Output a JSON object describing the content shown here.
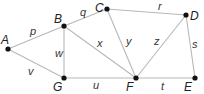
{
  "diagram": {
    "type": "undirected-graph",
    "colors": {
      "edge": "#b8b8b8",
      "node": "#111111",
      "text": "#222222"
    },
    "nodes": [
      {
        "id": "A",
        "label": "A",
        "x": 8,
        "y": 49,
        "lx": 1,
        "ly": 44
      },
      {
        "id": "B",
        "label": "B",
        "x": 64,
        "y": 26,
        "lx": 54,
        "ly": 23
      },
      {
        "id": "C",
        "label": "C",
        "x": 107,
        "y": 9,
        "lx": 95,
        "ly": 12
      },
      {
        "id": "D",
        "label": "D",
        "x": 186,
        "y": 15,
        "lx": 190,
        "ly": 20
      },
      {
        "id": "E",
        "label": "E",
        "x": 195,
        "y": 78,
        "lx": 184,
        "ly": 91
      },
      {
        "id": "F",
        "label": "F",
        "x": 136,
        "y": 78,
        "lx": 126,
        "ly": 91
      },
      {
        "id": "G",
        "label": "G",
        "x": 64,
        "y": 78,
        "lx": 53,
        "ly": 91
      }
    ],
    "edges": [
      {
        "from": "A",
        "to": "B",
        "label": "p",
        "lx": 30,
        "ly": 35
      },
      {
        "from": "A",
        "to": "G",
        "label": "v",
        "lx": 28,
        "ly": 75
      },
      {
        "from": "B",
        "to": "C",
        "label": "q",
        "lx": 80,
        "ly": 16
      },
      {
        "from": "B",
        "to": "G",
        "label": "w",
        "lx": 55,
        "ly": 57
      },
      {
        "from": "B",
        "to": "F",
        "label": "x",
        "lx": 97,
        "ly": 47
      },
      {
        "from": "C",
        "to": "D",
        "label": "r",
        "lx": 158,
        "ly": 10
      },
      {
        "from": "C",
        "to": "F",
        "label": "y",
        "lx": 126,
        "ly": 45
      },
      {
        "from": "F",
        "to": "D",
        "label": "z",
        "lx": 154,
        "ly": 45
      },
      {
        "from": "D",
        "to": "E",
        "label": "s",
        "lx": 192,
        "ly": 48
      },
      {
        "from": "G",
        "to": "F",
        "label": "u",
        "lx": 93,
        "ly": 89
      },
      {
        "from": "F",
        "to": "E",
        "label": "t",
        "lx": 161,
        "ly": 90
      }
    ]
  }
}
